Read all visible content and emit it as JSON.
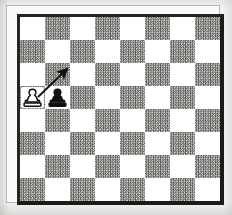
{
  "diagram": {
    "kind": "chess-board-diagram",
    "board": {
      "files": 8,
      "ranks": 8,
      "light_square_color": "#ffffff",
      "dark_square_color": "#6e6c68",
      "border_color": "#1d1b17",
      "top_left_square_shade": "light"
    },
    "pieces": [
      {
        "id": "white-pawn",
        "type": "pawn",
        "color": "white",
        "symbol": "♙",
        "column": 0,
        "row": 3,
        "label": "White pawn"
      },
      {
        "id": "black-pawn",
        "type": "pawn",
        "color": "black",
        "symbol": "♟",
        "column": 1,
        "row": 3,
        "label": "Black pawn"
      }
    ],
    "arrows": [
      {
        "id": "capture-arrow",
        "label": "White pawn captures diagonally",
        "from_column": 0,
        "from_row": 3,
        "to_column": 1,
        "to_row": 2,
        "color": "#141210",
        "start_x": 18,
        "start_y": 80,
        "end_x": 47,
        "end_y": 52
      }
    ],
    "page_background": "#f3f2f0",
    "paper_background": "#fbfafa"
  }
}
